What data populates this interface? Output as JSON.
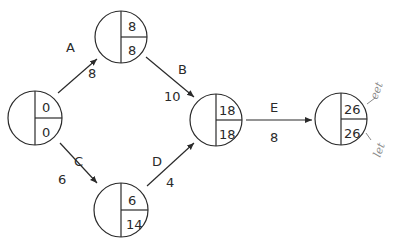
{
  "diagram": {
    "type": "activity-on-arrow network",
    "nodes": [
      {
        "id": "n1",
        "eet": "0",
        "let": "0"
      },
      {
        "id": "n2",
        "eet": "8",
        "let": "8"
      },
      {
        "id": "n3",
        "eet": "18",
        "let": "18"
      },
      {
        "id": "n4",
        "eet": "6",
        "let": "14"
      },
      {
        "id": "n5",
        "eet": "26",
        "let": "26"
      }
    ],
    "activities": [
      {
        "name": "A",
        "duration": "8",
        "from": "n1",
        "to": "n2"
      },
      {
        "name": "B",
        "duration": "10",
        "from": "n2",
        "to": "n3"
      },
      {
        "name": "C",
        "duration": "6",
        "from": "n1",
        "to": "n4"
      },
      {
        "name": "D",
        "duration": "4",
        "from": "n4",
        "to": "n3"
      },
      {
        "name": "E",
        "duration": "8",
        "from": "n3",
        "to": "n5"
      }
    ],
    "annotations": {
      "top": "eet",
      "bottom": "let"
    },
    "colors": {
      "line": "#2a2a2a",
      "handwriting": "#8a8a8a"
    }
  }
}
